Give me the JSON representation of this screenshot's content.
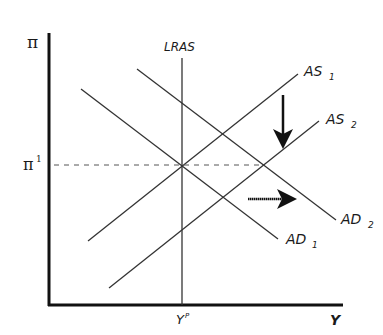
{
  "diagram": {
    "type": "AD-AS model",
    "axes": {
      "y_label": "π",
      "x_label": "Y",
      "y_tick_label": "π",
      "y_tick_superscript": "1",
      "x_tick_label": "Y",
      "x_tick_superscript": "P"
    },
    "curves": {
      "lras": {
        "label": "LRAS"
      },
      "as1": {
        "label": "AS",
        "sub": "1"
      },
      "as2": {
        "label": "AS",
        "sub": "2"
      },
      "ad1": {
        "label": "AD",
        "sub": "1"
      },
      "ad2": {
        "label": "AD",
        "sub": "2"
      }
    },
    "annotations": {
      "as_shift": "down arrow: AS shifts from AS1 to AS2",
      "ad_shift": "right arrow: AD shifts from AD1 to AD2"
    },
    "colors": {
      "ink": "#1a1a1a",
      "line": "#333333",
      "dash": "#555555"
    }
  }
}
